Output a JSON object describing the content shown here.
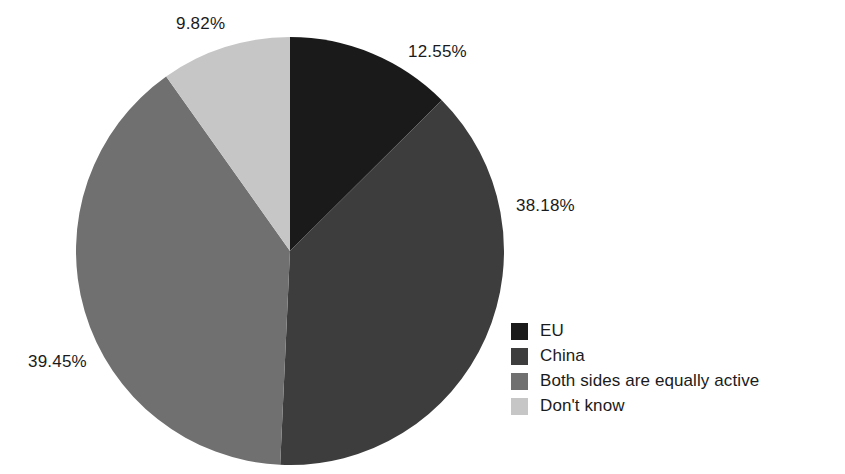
{
  "chart_data": {
    "type": "pie",
    "title": "",
    "subtitle": "",
    "xlabel": "",
    "ylabel": "",
    "legend_position": "right-bottom",
    "grid": false,
    "start_angle_deg": 0,
    "direction": "clockwise",
    "categories": [
      "EU",
      "China",
      "Both sides are equally active",
      "Don't know"
    ],
    "values": [
      12.55,
      38.18,
      39.45,
      9.82
    ],
    "value_unit": "%",
    "data_labels": [
      "12.55%",
      "38.18%",
      "39.45%",
      "9.82%"
    ],
    "colors": [
      "#1a1a1a",
      "#3d3d3d",
      "#707070",
      "#c6c6c6"
    ],
    "slices": [
      {
        "label": "EU",
        "value": 12.55,
        "display": "12.55%",
        "color": "#1a1a1a"
      },
      {
        "label": "China",
        "value": 38.18,
        "display": "38.18%",
        "color": "#3d3d3d"
      },
      {
        "label": "Both sides are equally active",
        "value": 39.45,
        "display": "39.45%",
        "color": "#707070"
      },
      {
        "label": "Don't know",
        "value": 9.82,
        "display": "9.82%",
        "color": "#c6c6c6"
      }
    ]
  },
  "labels": {
    "dont_know": "9.82%",
    "eu": "12.55%",
    "china": "38.18%",
    "both": "39.45%"
  },
  "legend": {
    "items": [
      {
        "label": "EU",
        "color": "#1a1a1a"
      },
      {
        "label": "China",
        "color": "#3d3d3d"
      },
      {
        "label": "Both sides are equally active",
        "color": "#707070"
      },
      {
        "label": "Don't know",
        "color": "#c6c6c6"
      }
    ]
  },
  "geometry": {
    "center_x": 290,
    "center_y": 251,
    "radius": 214
  }
}
